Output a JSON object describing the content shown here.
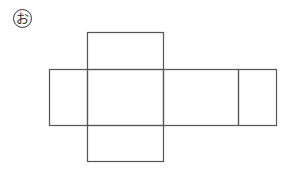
{
  "figure": {
    "label": "お",
    "stroke_color": "#555555",
    "faces": [
      {
        "name": "top-face",
        "x": 87,
        "y": 32,
        "w": 76,
        "h": 37
      },
      {
        "name": "left-face",
        "x": 49,
        "y": 69,
        "w": 38,
        "h": 56
      },
      {
        "name": "front-face",
        "x": 87,
        "y": 69,
        "w": 76,
        "h": 56
      },
      {
        "name": "right-long-face",
        "x": 163,
        "y": 69,
        "w": 75,
        "h": 56
      },
      {
        "name": "right-end-face",
        "x": 238,
        "y": 69,
        "w": 38,
        "h": 56
      },
      {
        "name": "bottom-face",
        "x": 87,
        "y": 125,
        "w": 76,
        "h": 36
      }
    ]
  }
}
